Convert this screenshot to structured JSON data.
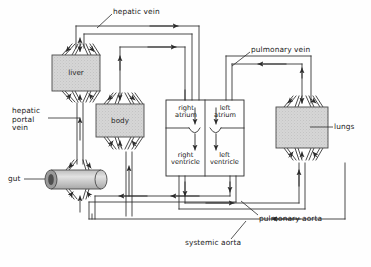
{
  "diagram": {
    "background": "#fefefe",
    "ink": "#2b2b2b",
    "organ_fill": "#d4d4d4",
    "organ_stroke": "#4a4a4a"
  },
  "organs": [
    {
      "id": "liver",
      "label": "liver",
      "shape": "rect",
      "x": 52,
      "y": 55,
      "w": 48,
      "h": 36
    },
    {
      "id": "body",
      "label": "body",
      "shape": "rect",
      "x": 96,
      "y": 104,
      "w": 48,
      "h": 33
    },
    {
      "id": "lungs",
      "label": "lungs",
      "shape": "rect",
      "x": 276,
      "y": 107,
      "w": 52,
      "h": 41
    },
    {
      "id": "gut",
      "label": "gut",
      "shape": "cylinder",
      "x": 45,
      "y": 170,
      "w": 62,
      "h": 19
    }
  ],
  "heart": {
    "outer": {
      "x": 166,
      "y": 100,
      "w": 78,
      "h": 76
    },
    "chambers": [
      {
        "id": "right-atrium",
        "label": "right\natrium",
        "side": "left"
      },
      {
        "id": "left-atrium",
        "label": "left\natrium",
        "side": "right"
      },
      {
        "id": "right-ventricle",
        "label": "right\nventricle",
        "side": "left"
      },
      {
        "id": "left-ventricle",
        "label": "left\nventricle",
        "side": "right"
      }
    ]
  },
  "vessel_labels": [
    {
      "id": "hepatic-vein",
      "text": "hepatic vein",
      "x": 113,
      "y": 8,
      "lines": 1
    },
    {
      "id": "pulmonary-vein",
      "text": "pulmonary vein",
      "x": 251,
      "y": 46,
      "lines": 1
    },
    {
      "id": "hepatic-portal-vein",
      "text": "hepatic\nportal\nvein",
      "x": 12,
      "y": 112,
      "lines": 3
    },
    {
      "id": "gut-label",
      "text": "gut",
      "x": 8,
      "y": 176,
      "lines": 1
    },
    {
      "id": "lungs-label",
      "text": "lungs",
      "x": 334,
      "y": 125,
      "lines": 1
    },
    {
      "id": "pulmonary-aorta",
      "text": "pulmonary aorta",
      "x": 259,
      "y": 219,
      "lines": 1
    },
    {
      "id": "systemic-aorta",
      "text": "systemic aorta",
      "x": 185,
      "y": 243,
      "lines": 1
    }
  ]
}
